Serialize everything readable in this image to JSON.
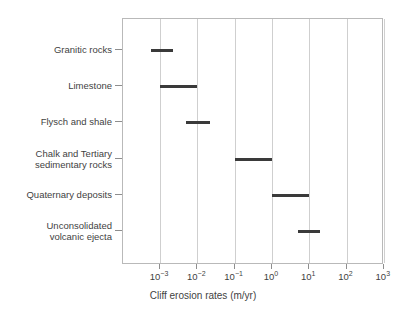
{
  "chart_data": {
    "type": "bar",
    "orientation": "horizontal",
    "title": "",
    "xlabel": "Cliff erosion rates (m/yr)",
    "ylabel": "",
    "x_scale": "log10",
    "xlim": [
      -3.5,
      3.0
    ],
    "grid": true,
    "legend": null,
    "x_ticks": [
      {
        "exponent": "−3",
        "label_base": "10",
        "value": 0.001
      },
      {
        "exponent": "−2",
        "label_base": "10",
        "value": 0.01
      },
      {
        "exponent": "−1",
        "label_base": "10",
        "value": 0.1
      },
      {
        "exponent": "0",
        "label_base": "10",
        "value": 1
      },
      {
        "exponent": "1",
        "label_base": "10",
        "value": 10
      },
      {
        "exponent": "2",
        "label_base": "10",
        "value": 100
      },
      {
        "exponent": "3",
        "label_base": "10",
        "value": 1000
      }
    ],
    "categories": [
      "Granitic rocks",
      "Limestone",
      "Flysch and shale",
      "Chalk and Tertiary\nsedimentary rocks",
      "Quaternary deposits",
      "Unconsolidated\nvolcanic ejecta"
    ],
    "ranges": [
      {
        "category": "Granitic rocks",
        "log_min": -3.25,
        "log_max": -2.65,
        "min": 0.00056,
        "max": 0.0022
      },
      {
        "category": "Limestone",
        "log_min": -3.0,
        "log_max": -2.0,
        "min": 0.001,
        "max": 0.01
      },
      {
        "category": "Flysch and shale",
        "log_min": -2.3,
        "log_max": -1.65,
        "min": 0.005,
        "max": 0.022
      },
      {
        "category": "Chalk and Tertiary sedimentary rocks",
        "log_min": -1.0,
        "log_max": 0.0,
        "min": 0.1,
        "max": 1.0
      },
      {
        "category": "Quaternary deposits",
        "log_min": 0.0,
        "log_max": 1.0,
        "min": 1.0,
        "max": 10.0
      },
      {
        "category": "Unconsolidated volcanic ejecta",
        "log_min": 0.7,
        "log_max": 1.3,
        "min": 5.0,
        "max": 20.0
      }
    ],
    "colors": {
      "bar": "#3a3a3a",
      "grid": "#cfcfcf",
      "frame": "#b9b9b9",
      "text": "#3f3f3f",
      "background": "#ffffff"
    }
  }
}
